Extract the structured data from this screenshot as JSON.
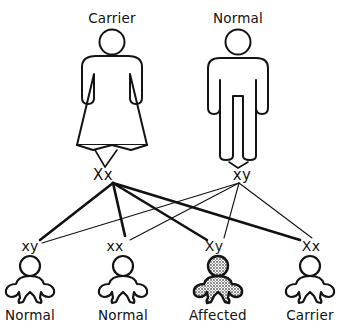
{
  "diagram": {
    "type": "pedigree",
    "topic": "X-linked recessive inheritance cross",
    "parents": [
      {
        "id": "mother",
        "title": "Carrier",
        "genotype": "Xx",
        "sex": "female",
        "shaded": false,
        "center_x": 112,
        "title_y": 12,
        "genotype_x": 103,
        "genotype_y": 168
      },
      {
        "id": "father",
        "title": "Normal",
        "genotype": "xy",
        "sex": "male",
        "shaded": false,
        "center_x": 238,
        "title_y": 12,
        "genotype_x": 242,
        "genotype_y": 168
      }
    ],
    "offspring": [
      {
        "id": "child-1",
        "genotype": "xy",
        "title": "Normal",
        "shaded": false,
        "center_x": 30,
        "genotype_x": 30,
        "genotype_y": 239,
        "title_y": 309
      },
      {
        "id": "child-2",
        "genotype": "xx",
        "title": "Normal",
        "shaded": false,
        "center_x": 123,
        "genotype_x": 115,
        "genotype_y": 239,
        "title_y": 309
      },
      {
        "id": "child-3",
        "genotype": "Xy",
        "title": "Affected",
        "shaded": true,
        "center_x": 218,
        "genotype_x": 214,
        "genotype_y": 239,
        "title_y": 309
      },
      {
        "id": "child-4",
        "genotype": "Xx",
        "title": "Carrier",
        "shaded": false,
        "center_x": 310,
        "genotype_x": 311,
        "genotype_y": 239,
        "title_y": 309
      }
    ],
    "colors": {
      "ink": "#121212",
      "background": "#ffffff",
      "affected_fill": "#b9b9b9"
    }
  }
}
